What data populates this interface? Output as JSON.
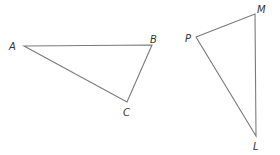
{
  "diagram": {
    "stroke_color": "#7a7a7a",
    "label_color": "#333333",
    "triangles": [
      {
        "name": "ABC",
        "vertices": [
          {
            "label": "A",
            "x": 24,
            "y": 46,
            "lx": 9,
            "ly": 50
          },
          {
            "label": "B",
            "x": 152,
            "y": 45,
            "lx": 150,
            "ly": 43
          },
          {
            "label": "C",
            "x": 127,
            "y": 102,
            "lx": 123,
            "ly": 116
          }
        ]
      },
      {
        "name": "PML",
        "vertices": [
          {
            "label": "P",
            "x": 196,
            "y": 37,
            "lx": 185,
            "ly": 42
          },
          {
            "label": "M",
            "x": 255,
            "y": 14,
            "lx": 257,
            "ly": 13
          },
          {
            "label": "L",
            "x": 256,
            "y": 136,
            "lx": 253,
            "ly": 150
          }
        ]
      }
    ]
  }
}
